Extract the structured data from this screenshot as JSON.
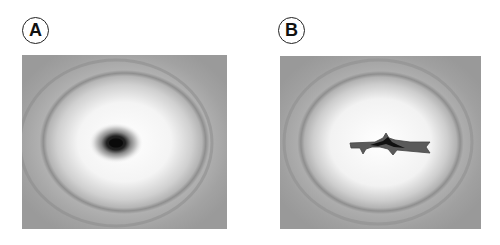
{
  "figure": {
    "panels": [
      {
        "label": "A",
        "description": "Diffraction-like pattern: grey background, faint outer ring, bright white halo, small dark elliptical center spot"
      },
      {
        "label": "B",
        "description": "Diffraction-like pattern: grey background, faint outer ring, bright white halo, elongated dark jagged horizontal streak at center"
      }
    ],
    "colors": {
      "background": "#9a9a9a",
      "halo": "#f6f6f6",
      "ring": "#8a8a8a",
      "center_dark": "#111111",
      "label_border": "#222222"
    }
  }
}
